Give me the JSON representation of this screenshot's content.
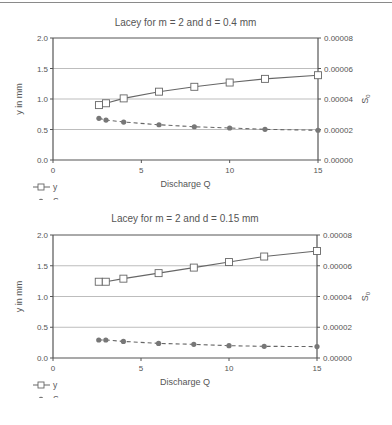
{
  "chart_data": [
    {
      "type": "line",
      "title": "Lacey for m = 2 and d = 0.4 mm",
      "xlabel": "Discharge Q",
      "ylabel": "y in mm",
      "y2label": "S0",
      "xlim": [
        0,
        15
      ],
      "ylim": [
        0,
        2.0
      ],
      "y2lim": [
        0,
        8e-05
      ],
      "xticks": [
        "0",
        "5",
        "10",
        "15"
      ],
      "yticks": [
        "0.0",
        "0.5",
        "1.0",
        "1.5",
        "2.0"
      ],
      "y2ticks": [
        "0.00000",
        "0.00002",
        "0.00004",
        "0.00006",
        "0.00008"
      ],
      "grid": "horizontal",
      "legend_position": "bottom-left",
      "x": [
        2.6,
        3,
        4,
        6,
        8,
        10,
        12,
        15
      ],
      "series": [
        {
          "name": "y",
          "axis": "left",
          "marker": "square-open",
          "line": "solid",
          "values": [
            0.9,
            0.93,
            1.01,
            1.12,
            1.2,
            1.27,
            1.33,
            1.39
          ]
        },
        {
          "name": "S0",
          "axis": "right",
          "marker": "circle-filled",
          "line": "dashed",
          "values": [
            2.73e-05,
            2.62e-05,
            2.49e-05,
            2.31e-05,
            2.18e-05,
            2.1e-05,
            2.01e-05,
            1.95e-05
          ]
        }
      ]
    },
    {
      "type": "line",
      "title": "Lacey for m = 2 and d = 0.15 mm",
      "xlabel": "Discharge Q",
      "ylabel": "y in mm",
      "y2label": "S0",
      "xlim": [
        0,
        15
      ],
      "ylim": [
        0,
        2.0
      ],
      "y2lim": [
        0,
        8e-05
      ],
      "xticks": [
        "0",
        "5",
        "10",
        "15"
      ],
      "yticks": [
        "0.0",
        "0.5",
        "1.0",
        "1.5",
        "2.0"
      ],
      "y2ticks": [
        "0.00000",
        "0.00002",
        "0.00004",
        "0.00006",
        "0.00008"
      ],
      "grid": "horizontal",
      "legend_position": "bottom-left",
      "x": [
        2.6,
        3,
        4,
        6,
        8,
        10,
        12,
        15
      ],
      "series": [
        {
          "name": "y",
          "axis": "left",
          "marker": "square-open",
          "line": "solid",
          "values": [
            1.24,
            1.24,
            1.29,
            1.38,
            1.47,
            1.56,
            1.65,
            1.74
          ]
        },
        {
          "name": "S0",
          "axis": "right",
          "marker": "circle-filled",
          "line": "dashed",
          "values": [
            1.17e-05,
            1.17e-05,
            1.08e-05,
            9.5e-06,
            8.9e-06,
            8e-06,
            7.6e-06,
            7.4e-06
          ]
        }
      ]
    }
  ],
  "legend": {
    "y_label": "y",
    "s0_label": "S",
    "s0_sub": "0"
  },
  "colors": {
    "axis": "#555555",
    "grid": "#bdbdbd",
    "line": "#666666",
    "marker_fill": "#777777"
  }
}
